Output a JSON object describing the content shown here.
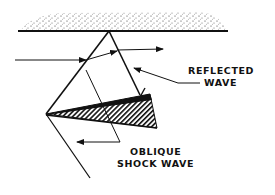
{
  "diagram": {
    "labels": {
      "reflected_line1": "REFLECTED",
      "reflected_line2": "WAVE",
      "oblique_line1": "OBLIQUE",
      "oblique_line2": "SHOCK WAVE"
    },
    "colors": {
      "ink": "#111111",
      "background": "#ffffff"
    }
  }
}
